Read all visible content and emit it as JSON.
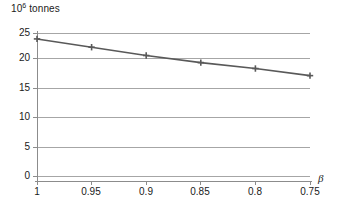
{
  "chart_data": {
    "type": "line",
    "title": "",
    "subtitle": "",
    "ylabel": "10^6 tonnes",
    "ylabel_mantissa": "10",
    "ylabel_exponent": "6",
    "ylabel_unit": " tonnes",
    "xlabel": "β",
    "x": [
      1,
      0.95,
      0.9,
      0.85,
      0.8,
      0.75
    ],
    "categories": [
      "1",
      "0.95",
      "0.9",
      "0.85",
      "0.8",
      "0.75"
    ],
    "values": [
      24.0,
      22.6,
      21.2,
      20.0,
      19.0,
      17.8
    ],
    "series": [
      {
        "name": "",
        "values": [
          24.0,
          22.6,
          21.2,
          20.0,
          19.0,
          17.8
        ]
      }
    ],
    "ylim": [
      0,
      25
    ],
    "yticks": [
      0,
      5,
      10,
      15,
      20,
      25
    ],
    "ytick_labels": [
      "0",
      "5",
      "10",
      "15",
      "20",
      "25"
    ],
    "xlim": [
      1,
      0.75
    ],
    "xticks": [
      1,
      0.95,
      0.9,
      0.85,
      0.8,
      0.75
    ],
    "xtick_labels": [
      "1",
      "0.95",
      "0.9",
      "0.85",
      "0.8",
      "0.75"
    ],
    "x_axis_reversed": true,
    "grid": true,
    "grid_axis": "y",
    "legend": false,
    "legend_position": "none",
    "marker": "plus",
    "line_color": "#595959",
    "grid_color": "#a6a6a6",
    "axis_color": "#8c8c8c",
    "text_color": "#1a1a1a",
    "background": "#ffffff"
  },
  "axis": {
    "y_tick_labels": [
      "25",
      "20",
      "15",
      "10",
      "5",
      "0"
    ],
    "x_tick_labels": [
      "1",
      "0.95",
      "0.9",
      "0.85",
      "0.8",
      "0.75"
    ],
    "x_title": "β"
  }
}
